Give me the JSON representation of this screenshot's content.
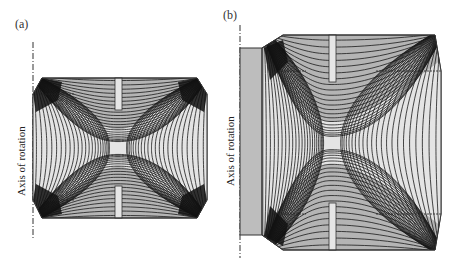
{
  "figure": {
    "panels": [
      {
        "id": "a",
        "label": "(a)",
        "axis_label": "Axis of rotation",
        "description": "Field-line contours in an axially symmetric electrode gap (short configuration)"
      },
      {
        "id": "b",
        "label": "(b)",
        "axis_label": "Axis of rotation",
        "description": "Field-line contours in an axially symmetric electrode gap (extended configuration with inner block)"
      }
    ],
    "colors": {
      "background": "#ffffff",
      "electrode_fill": "#b4b4b4",
      "inner_block_fill": "#bdbdbd",
      "gap_fill": "#e4e4e4",
      "slot_fill": "#e6e6e6",
      "contour_line": "#1a1a1a",
      "outline": "#333333"
    }
  }
}
